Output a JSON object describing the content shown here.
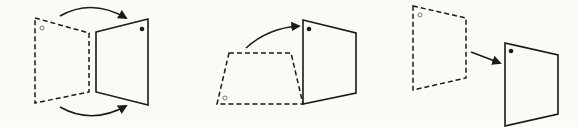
{
  "diagram": {
    "title": "",
    "background": "#fbfaf5",
    "stroke_color": "#1a1a1a",
    "figures": [
      {
        "name": "rotate-about-vertical-edge",
        "source_panel": {
          "style": "dashed",
          "points": "35,18 89,33 89,92 35,103",
          "marker": {
            "cx": 42,
            "cy": 28,
            "style": "hollow"
          }
        },
        "target_panel": {
          "style": "solid",
          "points": "96,32 148,19 148,105 96,92",
          "marker": {
            "cx": 142,
            "cy": 29,
            "style": "filled"
          }
        },
        "arrows": [
          {
            "path": "M60,16 Q92,-2 126,18"
          },
          {
            "path": "M60,107 Q92,125 126,106"
          }
        ]
      },
      {
        "name": "rotate-about-bottom-edge",
        "source_panel": {
          "style": "dashed",
          "points": "229,53 291,53 303,104 217,104",
          "marker": {
            "cx": 225,
            "cy": 98,
            "style": "hollow"
          }
        },
        "target_panel": {
          "style": "solid",
          "points": "303,20 356,33 356,93 303,104",
          "marker": {
            "cx": 309,
            "cy": 29,
            "style": "filled"
          }
        },
        "arrows": [
          {
            "path": "M246,48 Q268,28 299,26"
          }
        ]
      },
      {
        "name": "translate",
        "source_panel": {
          "style": "dashed",
          "points": "413,6 466,18 466,78 413,90",
          "marker": {
            "cx": 420,
            "cy": 15,
            "style": "hollow"
          }
        },
        "target_panel": {
          "style": "solid",
          "points": "505,43 558,55 558,114 505,126",
          "marker": {
            "cx": 511,
            "cy": 51,
            "style": "filled"
          }
        },
        "arrows": [
          {
            "path": "M471,52 L500,63"
          }
        ]
      }
    ]
  }
}
